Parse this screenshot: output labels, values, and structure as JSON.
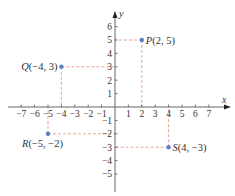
{
  "diagram": {
    "type": "cartesian-coordinate-plane",
    "axes": {
      "x_label": "x",
      "y_label": "y",
      "x_ticks": [
        -7,
        -6,
        -5,
        -4,
        -3,
        -2,
        -1,
        1,
        2,
        3,
        4,
        5,
        6,
        7
      ],
      "y_ticks": [
        6,
        5,
        4,
        3,
        2,
        1,
        -1,
        -2,
        -3,
        -4,
        -5
      ],
      "x_tick_labels": [
        "−7",
        "−6",
        "−5",
        "−4",
        "−3",
        "−2",
        "−1",
        "1",
        "2",
        "3",
        "4",
        "5",
        "6",
        "7"
      ],
      "y_tick_labels": [
        "6",
        "5",
        "4",
        "3",
        "2",
        "1",
        "−1",
        "−2",
        "−3",
        "−4",
        "−5"
      ]
    },
    "points": [
      {
        "name": "P",
        "x": 2,
        "y": 5,
        "coords": "(2, 5)"
      },
      {
        "name": "Q",
        "x": -4,
        "y": 3,
        "coords": "(−4, 3)"
      },
      {
        "name": "R",
        "x": -5,
        "y": -2,
        "coords": "(−5, −2)"
      },
      {
        "name": "S",
        "x": 4,
        "y": -3,
        "coords": "(4, −3)"
      }
    ],
    "colors": {
      "axis": "#555555",
      "point": "#5b7fc4",
      "guide": "#e89a8a",
      "text": "#333333"
    }
  }
}
